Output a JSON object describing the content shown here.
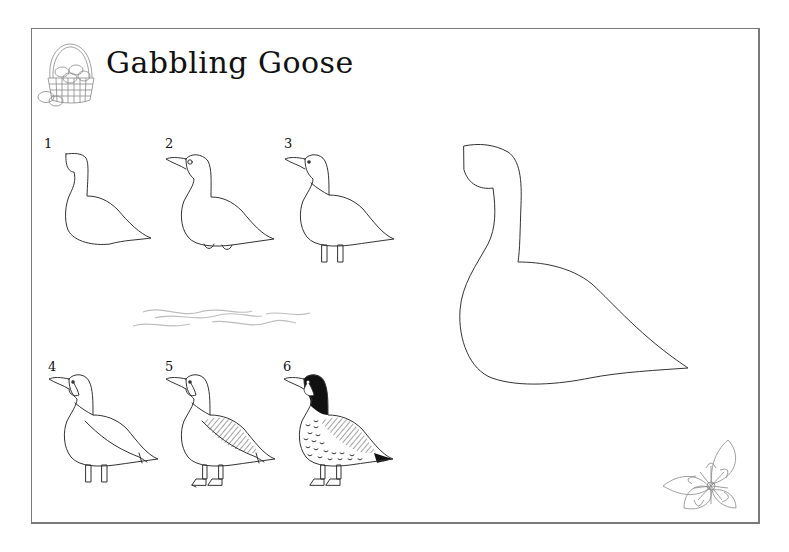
{
  "title": "Gabbling Goose",
  "steps": [
    {
      "label": "1"
    },
    {
      "label": "2"
    },
    {
      "label": "3"
    },
    {
      "label": "4"
    },
    {
      "label": "5"
    },
    {
      "label": "6"
    }
  ],
  "decorations": {
    "header_icon": "egg-basket-icon",
    "corner_icon": "flower-icon",
    "divider": "water-waves"
  },
  "colors": {
    "ink": "#333333",
    "border": "#7a7a7a",
    "background": "#ffffff"
  }
}
